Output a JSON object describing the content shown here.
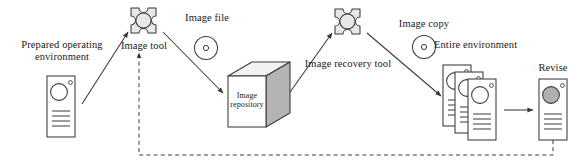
{
  "diagram": {
    "colors": {
      "stroke": "#3a3a3a",
      "gear_fill": "#e8e8e8",
      "box_side_fill": "#b4b4b4",
      "box_top_fill": "#f2f2f2",
      "disc_fill": "#ffffff",
      "revise_circle_fill": "#b0b0b0",
      "dashed_stroke": "#555555",
      "text": "#1a1a1a"
    },
    "nodes": [
      {
        "id": "prepared-operating-environment",
        "icon": "computer-tower-icon",
        "label": "Prepared operating\nenvironment",
        "label_line1": "Prepared operating",
        "label_line2": "environment"
      },
      {
        "id": "image-tool",
        "icon": "gear-icon",
        "label": "Image tool"
      },
      {
        "id": "image-file",
        "icon": "disc-icon",
        "label": "Image file"
      },
      {
        "id": "image-repository",
        "icon": "cube-box-icon",
        "label": "Image\nrepository",
        "label_line1": "Image",
        "label_line2": "repository"
      },
      {
        "id": "image-recovery-tool",
        "icon": "gear-icon",
        "label": "Image recovery tool"
      },
      {
        "id": "image-copy",
        "icon": "disc-icon",
        "label": "Image copy"
      },
      {
        "id": "entire-environment",
        "icon": "stacked-computers-icon",
        "label": "Entire environment"
      },
      {
        "id": "revise",
        "icon": "computer-tower-icon",
        "label": "Revise"
      }
    ],
    "edges": [
      {
        "id": "env-to-tool",
        "from": "prepared-operating-environment",
        "to": "image-tool",
        "style": "solid"
      },
      {
        "id": "tool-to-repository",
        "from": "image-tool",
        "to": "image-repository",
        "style": "solid"
      },
      {
        "id": "repository-to-recovery-tool",
        "from": "image-repository",
        "to": "image-recovery-tool",
        "style": "solid"
      },
      {
        "id": "recovery-tool-to-entire-environment",
        "from": "image-recovery-tool",
        "to": "entire-environment",
        "style": "solid"
      },
      {
        "id": "entire-environment-to-revise",
        "from": "entire-environment",
        "to": "revise",
        "style": "solid"
      },
      {
        "id": "revise-feedback-to-image-tool",
        "from": "revise",
        "to": "image-tool",
        "style": "dashed"
      }
    ]
  }
}
